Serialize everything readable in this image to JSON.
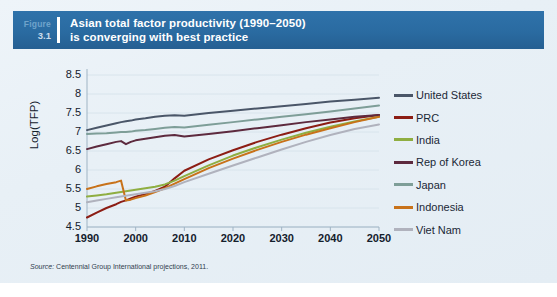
{
  "figure": {
    "label_word": "Figure",
    "number": "3.1",
    "title_line1": "Asian total factor productivity (1990–2050)",
    "title_line2": "is converging with best practice",
    "header_color": "#2b6ca3"
  },
  "source": {
    "label": "Source:",
    "text": "Centennial Group International projections, 2011."
  },
  "chart_data": {
    "type": "line",
    "title": "Asian total factor productivity (1990–2050) is converging with best practice",
    "xlabel": "",
    "ylabel": "Log(TFP)",
    "xlim": [
      1990,
      2050
    ],
    "ylim": [
      4.5,
      8.5
    ],
    "grid": true,
    "legend_position": "right",
    "xticks": [
      "1990",
      "2000",
      "2010",
      "2020",
      "2030",
      "2040",
      "2050"
    ],
    "yticks": [
      "8.5",
      "8",
      "7.5",
      "7",
      "6.5",
      "6",
      "5.5",
      "5",
      "4.5"
    ],
    "x": [
      1990,
      1992,
      1994,
      1996,
      1997,
      1998,
      1999,
      2000,
      2002,
      2004,
      2006,
      2008,
      2010,
      2015,
      2020,
      2025,
      2030,
      2035,
      2040,
      2045,
      2050
    ],
    "series": [
      {
        "name": "United States",
        "color": "#4a5668",
        "values": [
          7.05,
          7.11,
          7.17,
          7.23,
          7.26,
          7.28,
          7.3,
          7.33,
          7.36,
          7.4,
          7.43,
          7.44,
          7.43,
          7.5,
          7.56,
          7.62,
          7.68,
          7.74,
          7.8,
          7.85,
          7.9
        ]
      },
      {
        "name": "PRC",
        "color": "#8c1d14",
        "values": [
          4.75,
          4.88,
          5.0,
          5.1,
          5.16,
          5.2,
          5.25,
          5.3,
          5.37,
          5.45,
          5.56,
          5.78,
          5.98,
          6.28,
          6.52,
          6.74,
          6.93,
          7.1,
          7.25,
          7.36,
          7.45
        ]
      },
      {
        "name": "India",
        "color": "#8fae41",
        "values": [
          5.3,
          5.33,
          5.36,
          5.4,
          5.42,
          5.44,
          5.46,
          5.48,
          5.52,
          5.56,
          5.62,
          5.72,
          5.84,
          6.12,
          6.38,
          6.6,
          6.8,
          6.98,
          7.14,
          7.28,
          7.4
        ]
      },
      {
        "name": "Rep of Korea",
        "color": "#5d2a3e",
        "values": [
          6.55,
          6.62,
          6.68,
          6.74,
          6.76,
          6.68,
          6.74,
          6.78,
          6.82,
          6.86,
          6.9,
          6.92,
          6.88,
          6.95,
          7.02,
          7.1,
          7.18,
          7.26,
          7.33,
          7.4,
          7.45
        ]
      },
      {
        "name": "Japan",
        "color": "#7e9e98",
        "values": [
          6.95,
          6.96,
          6.97,
          6.99,
          7.0,
          7.0,
          7.01,
          7.03,
          7.05,
          7.08,
          7.11,
          7.13,
          7.12,
          7.19,
          7.26,
          7.33,
          7.4,
          7.47,
          7.54,
          7.62,
          7.7
        ]
      },
      {
        "name": "Indonesia",
        "color": "#c8721a",
        "values": [
          5.5,
          5.57,
          5.63,
          5.68,
          5.72,
          5.2,
          5.22,
          5.26,
          5.33,
          5.42,
          5.52,
          5.64,
          5.76,
          6.05,
          6.3,
          6.53,
          6.74,
          6.93,
          7.1,
          7.26,
          7.4
        ]
      },
      {
        "name": "Viet Nam",
        "color": "#b0b2bd",
        "values": [
          5.15,
          5.2,
          5.24,
          5.28,
          5.3,
          5.32,
          5.34,
          5.36,
          5.4,
          5.44,
          5.5,
          5.58,
          5.68,
          5.9,
          6.12,
          6.33,
          6.54,
          6.74,
          6.92,
          7.08,
          7.2
        ]
      }
    ]
  }
}
